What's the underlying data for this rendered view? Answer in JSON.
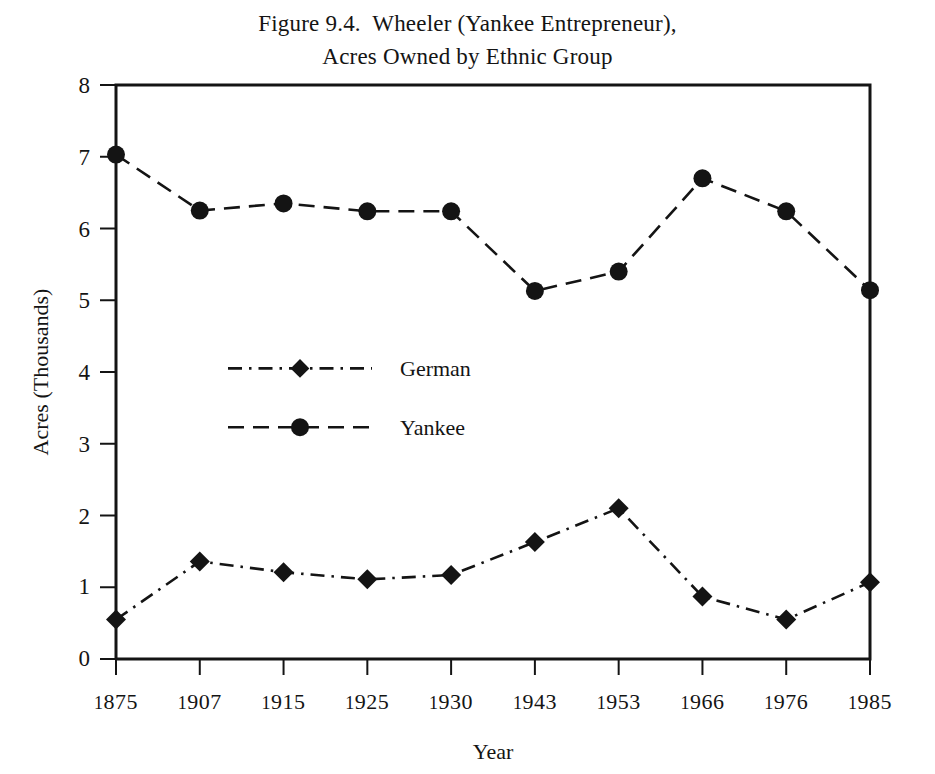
{
  "figure": {
    "title_lines": [
      "Figure 9.4.  Wheeler (Yankee Entrepreneur),",
      "Acres Owned by Ethnic Group"
    ],
    "background_color": "#ffffff",
    "ink_color": "#141414"
  },
  "chart_data": {
    "type": "line",
    "title": "Figure 9.4.  Wheeler (Yankee Entrepreneur), Acres Owned by Ethnic Group",
    "xlabel": "Year",
    "ylabel": "Acres (Thousands)",
    "categories": [
      "1875",
      "1907",
      "1915",
      "1925",
      "1930",
      "1943",
      "1953",
      "1966",
      "1976",
      "1985"
    ],
    "ytick_labels": [
      "0",
      "1",
      "2",
      "3",
      "4",
      "5",
      "6",
      "7",
      "8"
    ],
    "ytick_values": [
      0,
      1,
      2,
      3,
      4,
      5,
      6,
      7,
      8
    ],
    "ylim": [
      0,
      8
    ],
    "grid": false,
    "legend_position": "inside-center-left",
    "series": [
      {
        "name": "German",
        "marker": "diamond",
        "dash": "dash-dot",
        "color": "#141414",
        "values": [
          0.55,
          1.36,
          1.21,
          1.11,
          1.17,
          1.63,
          2.1,
          0.87,
          0.55,
          1.07
        ]
      },
      {
        "name": "Yankee",
        "marker": "circle",
        "dash": "dashed",
        "color": "#141414",
        "values": [
          7.03,
          6.25,
          6.35,
          6.24,
          6.24,
          5.13,
          5.4,
          6.7,
          6.24,
          5.14
        ]
      }
    ]
  },
  "legend": {
    "entries": [
      {
        "label": "German",
        "marker": "diamond-icon",
        "dash": "dash-dot"
      },
      {
        "label": "Yankee",
        "marker": "circle-icon",
        "dash": "dashed"
      }
    ]
  }
}
